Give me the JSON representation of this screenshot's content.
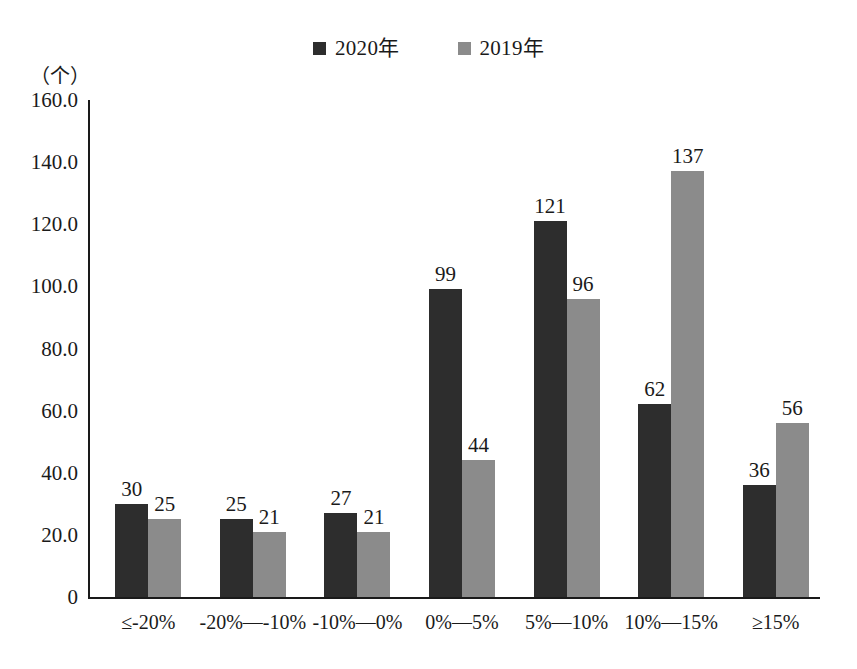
{
  "legend": {
    "position": "top-center",
    "entries": [
      {
        "label": "2020年",
        "color": "#2d2d2d",
        "icon": "square-marker"
      },
      {
        "label": "2019年",
        "color": "#8b8b8b",
        "icon": "square-marker"
      }
    ]
  },
  "axis": {
    "unit_caption": "（个）",
    "y_ticks": [
      "160.0",
      "140.0",
      "120.0",
      "100.0",
      "80.0",
      "60.0",
      "40.0",
      "20.0",
      "0"
    ]
  },
  "chart_data": {
    "type": "bar",
    "title": "",
    "subtitle": "",
    "xlabel": "",
    "ylabel": "（个）",
    "ylim": [
      0,
      160
    ],
    "ytick_values": [
      0,
      20,
      40,
      60,
      80,
      100,
      120,
      140,
      160
    ],
    "grid": false,
    "legend_position": "top-center",
    "categories": [
      "≤-20%",
      "-20%—-10%",
      "-10%—0%",
      "0%—5%",
      "5%—10%",
      "10%—15%",
      "≥15%"
    ],
    "series": [
      {
        "name": "2020年",
        "color": "#2d2d2d",
        "values": [
          30,
          25,
          27,
          99,
          121,
          62,
          36
        ],
        "labels": [
          "30",
          "25",
          "27",
          "99",
          "121",
          "62",
          "36"
        ]
      },
      {
        "name": "2019年",
        "color": "#8b8b8b",
        "values": [
          25,
          21,
          21,
          44,
          96,
          137,
          56
        ],
        "labels": [
          "25",
          "21",
          "21",
          "44",
          "96",
          "137",
          "56"
        ]
      }
    ]
  }
}
